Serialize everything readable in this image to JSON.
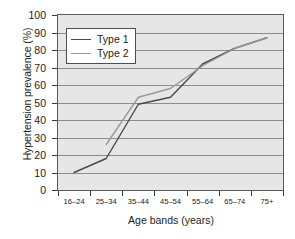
{
  "chart_data": {
    "type": "line",
    "title": "",
    "xlabel": "Age bands (years)",
    "ylabel": "Hypertension prevalence (%)",
    "categories": [
      "16–24",
      "25–34",
      "35–44",
      "45–54",
      "55–64",
      "65–74",
      "75+"
    ],
    "ylim": [
      0,
      100
    ],
    "ytick_values": [
      0,
      10,
      20,
      30,
      40,
      50,
      60,
      70,
      80,
      90,
      100
    ],
    "ytick_labels": [
      "0",
      "10",
      "20",
      "30",
      "40",
      "50",
      "60",
      "70",
      "80",
      "90",
      "100"
    ],
    "grid": "horizontal",
    "legend_position": "upper-left",
    "plot_background": "#e6e6e6",
    "series": [
      {
        "name": "Type 1",
        "color": "#4a4a4a",
        "values": [
          10,
          18,
          49,
          53,
          72,
          81,
          87
        ]
      },
      {
        "name": "Type 2",
        "color": "#9a9a9a",
        "values": [
          null,
          26,
          53,
          58,
          71,
          81,
          87
        ]
      }
    ]
  },
  "legend": {
    "items": [
      {
        "label": "Type 1"
      },
      {
        "label": "Type 2"
      }
    ]
  },
  "axes": {
    "y_title": "Hypertension prevalence (%)",
    "x_title": "Age bands (years)"
  }
}
